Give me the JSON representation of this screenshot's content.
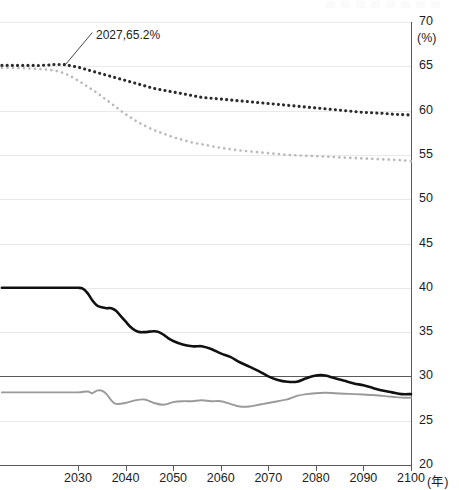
{
  "chart_data": {
    "type": "line",
    "title": "",
    "xlabel": "(年)",
    "ylabel": "(%)",
    "xlim": [
      2013.6,
      2100
    ],
    "ylim": [
      20,
      70
    ],
    "grid": true,
    "legend_position": "none",
    "x_ticks": [
      2030,
      2040,
      2050,
      2060,
      2070,
      2080,
      2090,
      2100
    ],
    "x_tick_labels": [
      "2030",
      "2040",
      "2050",
      "2060",
      "2070",
      "2080",
      "2090",
      "2100"
    ],
    "y_ticks": [
      20,
      25,
      30,
      35,
      40,
      45,
      50,
      55,
      60,
      65,
      70
    ],
    "y_tick_labels": [
      "20",
      "25",
      "30",
      "35",
      "40",
      "45",
      "50",
      "55",
      "60",
      "65",
      "70"
    ],
    "y_unit_label": "(%)",
    "x_unit_label": "(年)",
    "reference_line": {
      "value": 30,
      "emphasis": true
    },
    "annotations": [
      {
        "text": "2027,65.2%",
        "x": 2027,
        "y": 65.2,
        "label_x": 2033,
        "label_y": 68.8
      }
    ],
    "series": [
      {
        "name": "dark-dotted-upper",
        "style": "dotted",
        "color": "#2b2b2b",
        "x": [
          2014,
          2016,
          2018,
          2020,
          2022,
          2024,
          2025,
          2026,
          2027,
          2028,
          2030,
          2032,
          2034,
          2036,
          2038,
          2040,
          2042,
          2044,
          2046,
          2048,
          2050,
          2052,
          2054,
          2056,
          2058,
          2060,
          2062,
          2064,
          2066,
          2068,
          2070,
          2072,
          2074,
          2076,
          2078,
          2080,
          2082,
          2084,
          2086,
          2088,
          2090,
          2092,
          2094,
          2096,
          2098,
          2100
        ],
        "values": [
          65.1,
          65.1,
          65.1,
          65.1,
          65.1,
          65.15,
          65.2,
          65.2,
          65.2,
          65.1,
          64.9,
          64.6,
          64.3,
          64.0,
          63.7,
          63.4,
          63.1,
          62.8,
          62.5,
          62.3,
          62.1,
          61.9,
          61.7,
          61.5,
          61.4,
          61.3,
          61.2,
          61.1,
          61.0,
          60.9,
          60.8,
          60.7,
          60.6,
          60.5,
          60.4,
          60.3,
          60.2,
          60.1,
          60.0,
          59.9,
          59.8,
          59.75,
          59.7,
          59.6,
          59.55,
          59.5
        ]
      },
      {
        "name": "light-dotted-lower",
        "style": "dotted",
        "color": "#b9b9b9",
        "x": [
          2014,
          2016,
          2018,
          2020,
          2022,
          2024,
          2026,
          2028,
          2030,
          2032,
          2034,
          2036,
          2038,
          2040,
          2042,
          2044,
          2046,
          2048,
          2050,
          2052,
          2054,
          2056,
          2058,
          2060,
          2062,
          2064,
          2066,
          2068,
          2070,
          2072,
          2074,
          2076,
          2078,
          2080,
          2082,
          2084,
          2086,
          2088,
          2090,
          2092,
          2094,
          2096,
          2098,
          2100
        ],
        "values": [
          64.8,
          64.8,
          64.8,
          64.75,
          64.7,
          64.6,
          64.4,
          64.0,
          63.4,
          62.7,
          62.0,
          61.2,
          60.4,
          59.6,
          58.9,
          58.3,
          57.8,
          57.4,
          57.0,
          56.7,
          56.4,
          56.2,
          56.0,
          55.8,
          55.65,
          55.5,
          55.4,
          55.3,
          55.2,
          55.1,
          55.0,
          54.95,
          54.9,
          54.85,
          54.8,
          54.75,
          54.7,
          54.65,
          54.6,
          54.55,
          54.5,
          54.45,
          54.4,
          54.3
        ]
      },
      {
        "name": "black-solid",
        "style": "solid",
        "color": "#111111",
        "x": [
          2014,
          2018,
          2022,
          2026,
          2030,
          2031,
          2032,
          2033,
          2034,
          2035,
          2036,
          2037,
          2038,
          2039,
          2040,
          2041,
          2042,
          2043,
          2044,
          2045,
          2046,
          2047,
          2048,
          2049,
          2050,
          2052,
          2054,
          2055,
          2056,
          2058,
          2060,
          2062,
          2064,
          2066,
          2068,
          2070,
          2072,
          2074,
          2076,
          2078,
          2080,
          2081,
          2082,
          2084,
          2086,
          2088,
          2090,
          2092,
          2094,
          2096,
          2098,
          2100
        ],
        "values": [
          40.0,
          40.0,
          40.0,
          40.0,
          40.0,
          39.9,
          39.4,
          38.6,
          38.0,
          37.8,
          37.7,
          37.7,
          37.4,
          36.8,
          36.2,
          35.6,
          35.2,
          35.0,
          35.0,
          35.05,
          35.1,
          35.0,
          34.7,
          34.3,
          34.0,
          33.6,
          33.4,
          33.4,
          33.4,
          33.1,
          32.6,
          32.2,
          31.6,
          31.1,
          30.6,
          30.0,
          29.6,
          29.4,
          29.4,
          29.8,
          30.1,
          30.15,
          30.1,
          29.8,
          29.5,
          29.2,
          29.0,
          28.7,
          28.4,
          28.2,
          28.0,
          28.0
        ]
      },
      {
        "name": "gray-solid",
        "style": "solid",
        "color": "#9a9a9a",
        "x": [
          2014,
          2018,
          2022,
          2026,
          2030,
          2032,
          2033,
          2034,
          2035,
          2036,
          2037,
          2038,
          2040,
          2042,
          2044,
          2046,
          2048,
          2050,
          2052,
          2054,
          2056,
          2058,
          2060,
          2062,
          2064,
          2066,
          2068,
          2070,
          2072,
          2074,
          2076,
          2078,
          2080,
          2082,
          2084,
          2086,
          2088,
          2090,
          2092,
          2094,
          2096,
          2098,
          2100
        ],
        "values": [
          28.2,
          28.2,
          28.2,
          28.2,
          28.2,
          28.3,
          28.1,
          28.4,
          28.4,
          28.0,
          27.3,
          26.9,
          27.0,
          27.3,
          27.4,
          27.0,
          26.8,
          27.1,
          27.2,
          27.2,
          27.3,
          27.2,
          27.2,
          26.9,
          26.6,
          26.6,
          26.8,
          27.0,
          27.2,
          27.4,
          27.8,
          28.0,
          28.1,
          28.15,
          28.1,
          28.05,
          28.0,
          27.95,
          27.9,
          27.8,
          27.7,
          27.6,
          27.6
        ]
      }
    ]
  }
}
